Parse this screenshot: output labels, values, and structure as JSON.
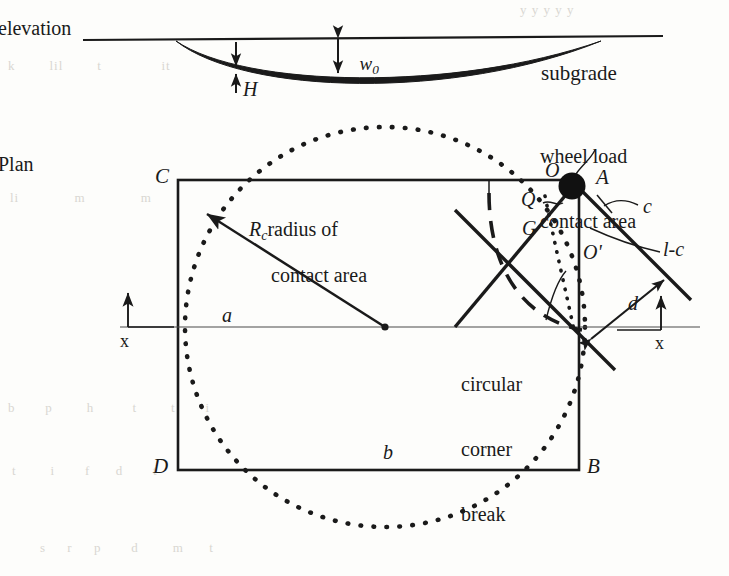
{
  "figure": {
    "colors": {
      "ink": "#1a1a1a",
      "thin_line": "#3a3a3a",
      "ghost": "#d9d7d2",
      "paper": "#fdfdfb"
    }
  },
  "elevation": {
    "view_label": "elevation",
    "subgrade_label": "subgrade",
    "deflection_label": "w",
    "deflection_sub": "0",
    "thickness_label": "H"
  },
  "plan": {
    "view_label": "Plan",
    "vertices": {
      "top_left": "C",
      "top_right": "A",
      "bottom_left": "D",
      "bottom_right": "B"
    },
    "points": {
      "o": "O",
      "q": "Q",
      "g": "G",
      "o_prime": "O'"
    },
    "dimensions": {
      "a": "a",
      "b": "b",
      "c": "c",
      "l_minus_c": "l-c",
      "d": "d"
    },
    "axis_label_left": "x",
    "axis_label_right": "x",
    "annotations": {
      "radius": {
        "symbol": "R",
        "symbol_sub": "c",
        "line1": "radius of",
        "line2": "contact area"
      },
      "wheel_load": {
        "line1": "wheel load",
        "line2": "contact area"
      },
      "corner_break": {
        "line1": "circular",
        "line2": "corner",
        "line3": "break"
      }
    }
  },
  "ghost_text": {
    "top_right": "y y y y y",
    "row1": "k        lil        t              it",
    "row2": "li             m             m",
    "row3": "b       p        h         t        t       i",
    "row4": "t        i       f      d       t",
    "bottom": "s     r     p       d        m      t"
  }
}
